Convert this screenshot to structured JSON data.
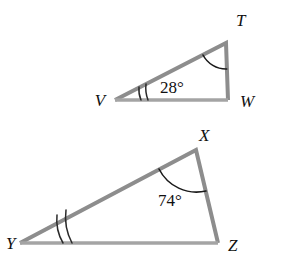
{
  "figure": {
    "background_color": "#ffffff",
    "side_color": "#8d8d8d",
    "base_color": "#a4a4a4",
    "arc_color": "#1a1a1a",
    "label_color": "#111111",
    "triangles": [
      {
        "name": "triangle-tvw",
        "vertices": {
          "T": {
            "label": "T",
            "x": 226,
            "y": 43,
            "label_x": 236,
            "label_y": 26
          },
          "V": {
            "label": "V",
            "x": 115,
            "y": 100,
            "label_x": 100,
            "label_y": 106
          },
          "W": {
            "label": "W",
            "x": 228,
            "y": 100,
            "label_x": 240,
            "label_y": 107
          }
        },
        "angle_measure": {
          "text": "28°",
          "value": 28,
          "at_vertex": "V",
          "label_x": 160,
          "label_y": 93
        },
        "arc_vertex": "T",
        "tick_vertex": "V",
        "tick_count": 2
      },
      {
        "name": "triangle-xyz",
        "vertices": {
          "X": {
            "label": "X",
            "x": 196,
            "y": 150,
            "label_x": 199,
            "label_y": 141
          },
          "Y": {
            "label": "Y",
            "x": 20,
            "y": 243,
            "label_x": 6,
            "label_y": 249
          },
          "Z": {
            "label": "Z",
            "x": 218,
            "y": 243,
            "label_x": 228,
            "label_y": 251
          }
        },
        "angle_measure": {
          "text": "74°",
          "value": 74,
          "at_vertex": "X",
          "label_x": 158,
          "label_y": 206
        },
        "arc_vertex": "X",
        "tick_vertex": "Y",
        "tick_count": 2
      }
    ]
  }
}
